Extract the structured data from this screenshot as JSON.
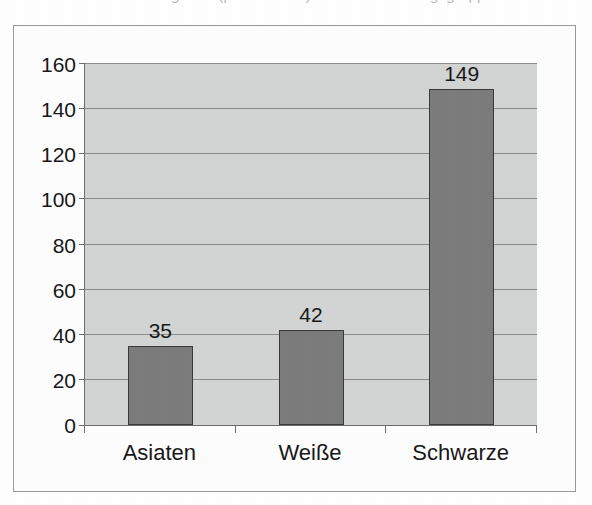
{
  "title_remnant": "Inhaftierungsrate (pro 100.000) nach Bevölkerungsgruppe",
  "colors": {
    "plot_background": "#d3d4d4",
    "bar_fill": "#7c7c7c",
    "bar_border": "#3a3a3a",
    "gridline": "#8b8b8b",
    "axis": "#6e6e6e",
    "frame_border": "#9a9a9a",
    "page_background": "#ffffff",
    "text": "#18181a"
  },
  "chart_data": {
    "type": "bar",
    "title": "",
    "xlabel": "",
    "ylabel": "",
    "categories": [
      "Asiaten",
      "Weiße",
      "Schwarze"
    ],
    "values": [
      35,
      42,
      149
    ],
    "data_labels": [
      "35",
      "42",
      "149"
    ],
    "ylim": [
      0,
      160
    ],
    "ytick_step": 20,
    "yticks": [
      0,
      20,
      40,
      60,
      80,
      100,
      120,
      140,
      160
    ],
    "ytick_labels": [
      "0",
      "20",
      "40",
      "60",
      "80",
      "100",
      "120",
      "140",
      "160"
    ],
    "grid": true,
    "grid_axis": "y",
    "legend": false,
    "legend_position": "none",
    "series": [
      {
        "name": "",
        "values": [
          35,
          42,
          149
        ]
      }
    ]
  }
}
